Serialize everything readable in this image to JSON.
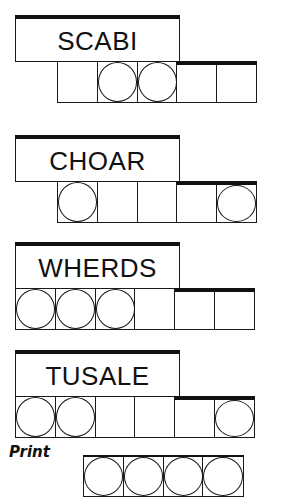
{
  "puzzles": [
    {
      "scrambled": "SCABI",
      "cell_count": 5,
      "circled": [
        false,
        true,
        true,
        false,
        false
      ]
    },
    {
      "scrambled": "CHOAR",
      "cell_count": 5,
      "circled": [
        true,
        false,
        false,
        false,
        true
      ]
    },
    {
      "scrambled": "WHERDS",
      "cell_count": 6,
      "circled": [
        true,
        true,
        true,
        false,
        false,
        false
      ]
    },
    {
      "scrambled": "TUSALE",
      "cell_count": 6,
      "circled": [
        true,
        true,
        false,
        false,
        false,
        true
      ]
    }
  ],
  "answer": {
    "label": "Print",
    "cell_count": 4,
    "circled": [
      true,
      true,
      true,
      true
    ]
  },
  "colors": {
    "ink": "#111111",
    "background": "#ffffff"
  }
}
